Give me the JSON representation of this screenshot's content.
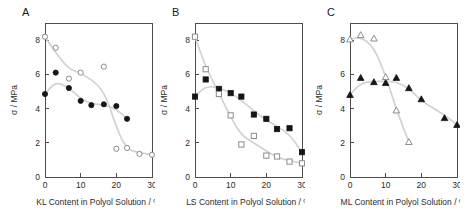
{
  "figure": {
    "background": "#ffffff",
    "line_color": "#d2d2d2",
    "filled_color": "#151515",
    "open_color": "#8c8c8c",
    "axis_color": "#4d4d4d"
  },
  "panels": [
    {
      "letter": "A",
      "xlabel": "KL Content in Polyol Solution / %",
      "ylabel": "σ / MPa",
      "xticks": [
        "0",
        "10",
        "20",
        "30"
      ],
      "yticks": [
        "0",
        "2",
        "4",
        "6",
        "8"
      ]
    },
    {
      "letter": "B",
      "xlabel": "LS Content in Polyol Solution / %",
      "ylabel": "σ / MPa",
      "xticks": [
        "0",
        "10",
        "20",
        "30"
      ],
      "yticks": [
        "0",
        "2",
        "4",
        "6",
        "8"
      ]
    },
    {
      "letter": "C",
      "xlabel": "ML Content in Polyol Solution / %",
      "ylabel": "σ / MPa",
      "xticks": [
        "0",
        "10",
        "20",
        "30"
      ],
      "yticks": [
        "0",
        "2",
        "4",
        "6",
        "8"
      ]
    }
  ],
  "chart_data": [
    {
      "type": "scatter",
      "panel": "A",
      "title": "A",
      "xlabel": "KL Content in Polyol Solution / %",
      "ylabel": "σ / MPa",
      "xlim": [
        0,
        30
      ],
      "ylim": [
        0,
        9
      ],
      "xticks": [
        0,
        10,
        20,
        30
      ],
      "yticks": [
        0,
        2,
        4,
        6,
        8
      ],
      "grid": false,
      "legend": "none",
      "series": [
        {
          "name": "filled circles",
          "marker": "circle-filled",
          "x": [
            0,
            3,
            6.7,
            10,
            13,
            16.5,
            20,
            23
          ],
          "y": [
            4.85,
            6.1,
            5.2,
            4.45,
            4.2,
            4.25,
            4.15,
            3.4
          ],
          "trendline": true
        },
        {
          "name": "open circles",
          "marker": "circle-open",
          "x": [
            0,
            3,
            6.7,
            10,
            16.5,
            20,
            23,
            26.5,
            30
          ],
          "y": [
            8.2,
            7.55,
            5.75,
            6.1,
            6.45,
            1.65,
            1.7,
            1.35,
            1.3
          ],
          "trendline": true
        }
      ]
    },
    {
      "type": "scatter",
      "panel": "B",
      "title": "B",
      "xlabel": "LS Content in Polyol Solution / %",
      "ylabel": "σ / MPa",
      "xlim": [
        0,
        30
      ],
      "ylim": [
        0,
        9
      ],
      "xticks": [
        0,
        10,
        20,
        30
      ],
      "yticks": [
        0,
        2,
        4,
        6,
        8
      ],
      "grid": false,
      "legend": "none",
      "series": [
        {
          "name": "filled squares",
          "marker": "square-filled",
          "x": [
            0,
            3,
            6.7,
            10,
            13,
            16.5,
            20,
            23,
            26.5,
            30
          ],
          "y": [
            4.7,
            5.7,
            5.15,
            4.9,
            4.7,
            3.65,
            3.4,
            2.8,
            2.85,
            1.45
          ],
          "trendline": true
        },
        {
          "name": "open squares",
          "marker": "square-open",
          "x": [
            0,
            3,
            6.7,
            10,
            13,
            16.5,
            20,
            23,
            26.5,
            30
          ],
          "y": [
            8.2,
            6.3,
            4.85,
            3.6,
            1.9,
            2.4,
            1.25,
            1.2,
            0.9,
            0.8
          ],
          "trendline": true
        }
      ]
    },
    {
      "type": "scatter",
      "panel": "C",
      "title": "C",
      "xlabel": "ML Content in Polyol Solution / %",
      "ylabel": "σ / MPa",
      "xlim": [
        0,
        30
      ],
      "ylim": [
        0,
        9
      ],
      "xticks": [
        0,
        10,
        20,
        30
      ],
      "yticks": [
        0,
        2,
        4,
        6,
        8
      ],
      "grid": false,
      "legend": "none",
      "series": [
        {
          "name": "filled triangles",
          "marker": "triangle-filled",
          "x": [
            0,
            3,
            6.7,
            10,
            13,
            16.5,
            20,
            26.5,
            30
          ],
          "y": [
            4.8,
            5.8,
            5.55,
            5.5,
            5.8,
            5.2,
            4.55,
            3.45,
            3.05
          ],
          "trendline": true
        },
        {
          "name": "open triangles",
          "marker": "triangle-open",
          "x": [
            0,
            3,
            6.7,
            10,
            13,
            16.5
          ],
          "y": [
            8.05,
            8.3,
            8.1,
            5.85,
            3.9,
            2.05
          ],
          "trendline": true
        }
      ]
    }
  ]
}
